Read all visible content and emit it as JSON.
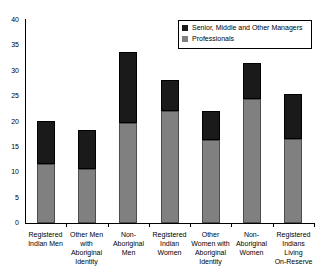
{
  "chart_data": {
    "type": "bar",
    "subtype": "stacked-vertical",
    "title": "",
    "xlabel": "",
    "ylabel": "",
    "ylim": [
      0,
      40
    ],
    "yticks": [
      0,
      5,
      10,
      15,
      20,
      25,
      30,
      35,
      40
    ],
    "ytick_labels": [
      "0",
      "5",
      "10",
      "15",
      "20",
      "25",
      "30",
      "35",
      "40"
    ],
    "grid": false,
    "legend_position": "top-right",
    "categories": [
      "Registered\nIndian Men",
      "Other Men\nwith\nAboriginal\nIdentity",
      "Non-\nAboriginal\nMen",
      "Registered\nIndian\nWomen",
      "Other\nWomen with\nAboriginal\nIdentity",
      "Non-\nAboriginal\nWomen",
      "Registered\nIndians Living\nOn-Reserve"
    ],
    "series": [
      {
        "name": "Professionals",
        "color": "#808080",
        "values": [
          11.7,
          10.6,
          19.7,
          22.0,
          16.4,
          24.4,
          16.6
        ]
      },
      {
        "name": "Senior, Middle and Other Managers",
        "color": "#1a1a1a",
        "values": [
          8.4,
          7.7,
          13.9,
          6.2,
          5.7,
          7.1,
          8.9
        ]
      }
    ],
    "totals": [
      20.1,
      18.3,
      33.6,
      28.2,
      22.1,
      31.5,
      25.5
    ]
  },
  "legend": {
    "entries": [
      {
        "label": "Senior, Middle and Other Managers",
        "color": "#1a1a1a"
      },
      {
        "label": "Professionals",
        "color": "#808080"
      }
    ]
  },
  "colors": {
    "managers": "#1a1a1a",
    "professionals": "#808080",
    "axis": "#000000",
    "background": "#ffffff"
  }
}
